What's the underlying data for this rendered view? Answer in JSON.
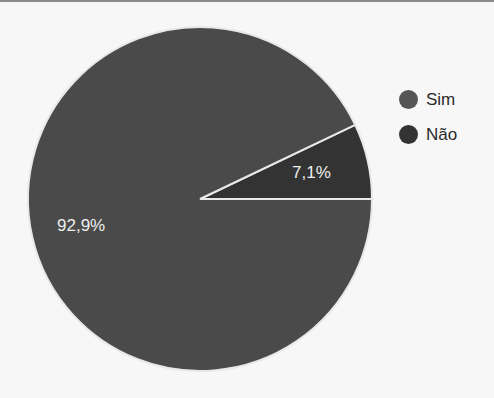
{
  "chart_data": {
    "type": "pie",
    "title": "",
    "categories": [
      "Sim",
      "Não"
    ],
    "values": [
      92.9,
      7.1
    ],
    "labels": [
      "92,9%",
      "7,1%"
    ],
    "colors": [
      "#4a4a4a",
      "#333333"
    ],
    "legend_position": "right"
  },
  "legend": {
    "items": [
      {
        "label": "Sim",
        "color": "#555555"
      },
      {
        "label": "Não",
        "color": "#333333"
      }
    ]
  },
  "slice_labels": {
    "sim": "92,9%",
    "nao": "7,1%"
  }
}
